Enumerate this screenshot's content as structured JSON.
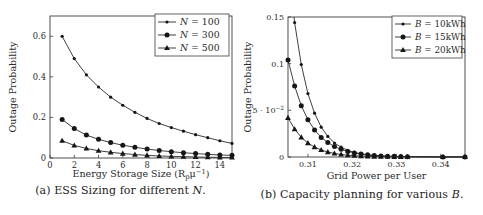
{
  "figure": {
    "background": "#ffffff",
    "ink_color": "#2b2b2b",
    "frame_color": "#3c3c3c",
    "marker_color": "#161616"
  },
  "chart_data": [
    {
      "type": "line",
      "title": "",
      "xlabel": "Energy Storage Size (R_{p}μ^{−1})",
      "ylabel": "Outage Probability",
      "caption": {
        "prefix": "(a) ESS Sizing for different ",
        "var": "N",
        "suffix": "."
      },
      "xlim": [
        0,
        15
      ],
      "ylim": [
        0,
        0.7
      ],
      "grid": false,
      "legend_position": "top-right",
      "xticks": [
        0,
        2,
        4,
        6,
        8,
        10,
        12,
        14
      ],
      "xtick_labels": [
        "0",
        "2",
        "4",
        "6",
        "8",
        "10",
        "12",
        "14"
      ],
      "yticks": [
        0,
        0.2,
        0.4,
        0.6
      ],
      "ytick_labels": [
        "0",
        "0.2",
        "0.4",
        "0.6"
      ],
      "x": [
        1,
        2,
        3,
        4,
        5,
        6,
        7,
        8,
        9,
        10,
        11,
        12,
        13,
        14,
        15
      ],
      "series": [
        {
          "name": "N = 100",
          "marker": "dot",
          "values": [
            0.6,
            0.49,
            0.41,
            0.35,
            0.3,
            0.26,
            0.225,
            0.195,
            0.17,
            0.15,
            0.132,
            0.115,
            0.1,
            0.085,
            0.072
          ]
        },
        {
          "name": "N = 300",
          "marker": "circle",
          "values": [
            0.19,
            0.145,
            0.113,
            0.092,
            0.076,
            0.063,
            0.053,
            0.044,
            0.037,
            0.031,
            0.026,
            0.022,
            0.018,
            0.015,
            0.013
          ]
        },
        {
          "name": "N = 500",
          "marker": "triangle",
          "values": [
            0.085,
            0.062,
            0.047,
            0.036,
            0.028,
            0.022,
            0.017,
            0.013,
            0.01,
            0.008,
            0.0065,
            0.005,
            0.004,
            0.003,
            0.0025
          ]
        }
      ]
    },
    {
      "type": "line",
      "title": "",
      "xlabel": "Grid Power per User",
      "ylabel": "Outage Probability",
      "caption": {
        "prefix": "(b) Capacity planning for various ",
        "var": "B",
        "suffix": "."
      },
      "xlim": [
        0.3055,
        0.3455
      ],
      "ylim": [
        0,
        0.15
      ],
      "grid": false,
      "legend_position": "top-right",
      "xticks": [
        0.31,
        0.32,
        0.33,
        0.34
      ],
      "xtick_labels": [
        "0.31",
        "0.32",
        "0.33",
        "0.34"
      ],
      "yticks": [
        0,
        0.05,
        0.1,
        0.15
      ],
      "ytick_labels": [
        "0",
        "5 · 10^{−2}",
        "0.1",
        "0.15"
      ],
      "x": [
        0.3055,
        0.307,
        0.3085,
        0.31,
        0.3115,
        0.313,
        0.3145,
        0.316,
        0.3175,
        0.319,
        0.3205,
        0.322,
        0.3235,
        0.325,
        0.3265,
        0.328,
        0.3295,
        0.331,
        0.3325,
        0.3405,
        0.3455
      ],
      "series": [
        {
          "name": "B = 10kWh",
          "marker": "dot",
          "values": [
            0.21,
            0.144,
            0.099,
            0.068,
            0.047,
            0.032,
            0.022,
            0.015,
            0.0105,
            0.0072,
            0.0049,
            0.0034,
            0.0023,
            0.0016,
            0.0011,
            0.0008,
            0.0005,
            0.0004,
            0.0003,
            0.0001,
            0.0001
          ]
        },
        {
          "name": "B = 15kWh",
          "marker": "circle",
          "values": [
            0.104,
            0.076,
            0.055,
            0.04,
            0.029,
            0.021,
            0.0155,
            0.0113,
            0.0082,
            0.006,
            0.0044,
            0.0032,
            0.0023,
            0.0017,
            0.0012,
            0.0009,
            0.0007,
            0.0005,
            0.0004,
            0.0001,
            0.0001
          ]
        },
        {
          "name": "B = 20kWh",
          "marker": "triangle",
          "values": [
            0.042,
            0.0298,
            0.0211,
            0.0149,
            0.0106,
            0.0075,
            0.0053,
            0.0038,
            0.0027,
            0.0019,
            0.0014,
            0.001,
            0.0007,
            0.0005,
            0.0004,
            0.0003,
            0.0002,
            0.0002,
            0.0001,
            0.0001,
            0.0
          ]
        }
      ]
    }
  ]
}
